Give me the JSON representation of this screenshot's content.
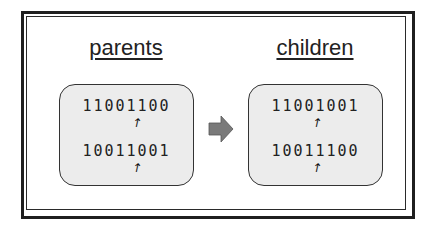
{
  "diagram": {
    "parents": {
      "label": "parents",
      "chromosomes": [
        "11001100",
        "10011001"
      ],
      "crossover_point_after_bit": 5
    },
    "children": {
      "label": "children",
      "chromosomes": [
        "11001001",
        "10011100"
      ],
      "crossover_point_after_bit": 5
    },
    "transition_arrow": "right-arrow",
    "pointer_glyph": "↑",
    "colors": {
      "box_fill": "#ececec",
      "box_border": "#333333",
      "arrow_fill": "#7a7a7a",
      "frame": "#1f1f1f",
      "text": "#222222"
    }
  }
}
